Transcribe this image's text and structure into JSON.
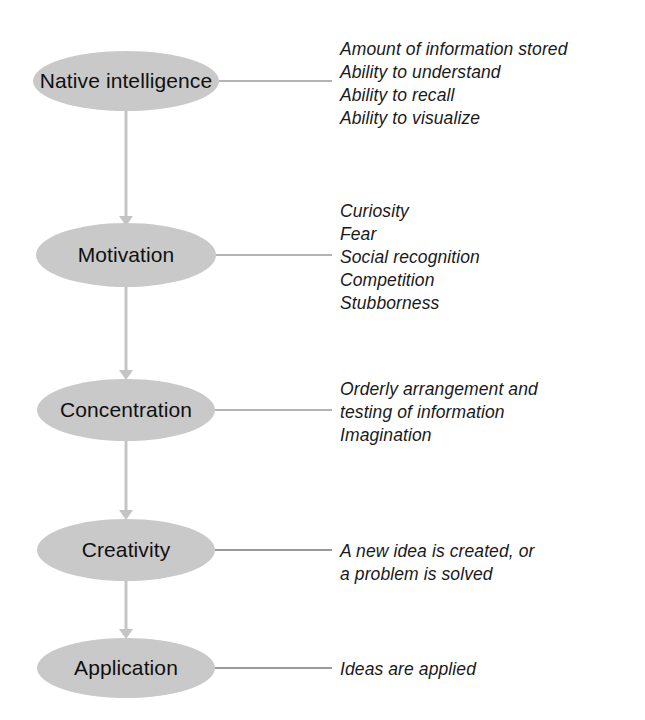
{
  "diagram": {
    "type": "vertical-flow-chart",
    "background_color": "#ffffff",
    "node_fill_color": "#c9c9c9",
    "connector_color": "#c4c4c4",
    "leader_color": "#b3b3b3",
    "text_color": "#101010",
    "nodes": [
      {
        "id": "native-intelligence",
        "label": "Native intelligence",
        "center_x": 126,
        "center_y": 81,
        "rx": 93,
        "ry": 30,
        "annotation_top": 38,
        "annotation": "Amount of information stored\nAbility to understand\nAbility to recall\nAbility to visualize"
      },
      {
        "id": "motivation",
        "label": "Motivation",
        "center_x": 126,
        "center_y": 255,
        "rx": 90,
        "ry": 32,
        "annotation_top": 200,
        "annotation": "Curiosity\nFear\nSocial recognition\nCompetition\nStubborness"
      },
      {
        "id": "concentration",
        "label": "Concentration",
        "center_x": 126,
        "center_y": 410,
        "rx": 89,
        "ry": 31,
        "annotation_top": 378,
        "annotation": "Orderly arrangement and\ntesting of information\nImagination"
      },
      {
        "id": "creativity",
        "label": "Creativity",
        "center_x": 126,
        "center_y": 550,
        "rx": 89,
        "ry": 31,
        "annotation_top": 540,
        "annotation": "A new idea is created, or\na problem is solved"
      },
      {
        "id": "application",
        "label": "Application",
        "center_x": 126,
        "center_y": 668,
        "rx": 89,
        "ry": 30,
        "annotation_top": 658,
        "annotation": "Ideas are applied"
      }
    ],
    "connectors": [
      {
        "from": "native-intelligence",
        "to": "motivation",
        "x": 126,
        "y_start": 111,
        "y_end": 223
      },
      {
        "from": "motivation",
        "to": "concentration",
        "x": 126,
        "y_start": 287,
        "y_end": 379
      },
      {
        "from": "concentration",
        "to": "creativity",
        "x": 126,
        "y_start": 441,
        "y_end": 519
      },
      {
        "from": "creativity",
        "to": "application",
        "x": 126,
        "y_start": 581,
        "y_end": 638
      }
    ],
    "leaders": [
      {
        "node": "native-intelligence",
        "x_start": 219,
        "x_end": 332,
        "y": 81,
        "weight": "light"
      },
      {
        "node": "motivation",
        "x_start": 216,
        "x_end": 332,
        "y": 255,
        "weight": "light"
      },
      {
        "node": "concentration",
        "x_start": 215,
        "x_end": 332,
        "y": 410,
        "weight": "light"
      },
      {
        "node": "creativity",
        "x_start": 215,
        "x_end": 332,
        "y": 550,
        "weight": "dark"
      },
      {
        "node": "application",
        "x_start": 215,
        "x_end": 332,
        "y": 668,
        "weight": "dark"
      }
    ]
  }
}
